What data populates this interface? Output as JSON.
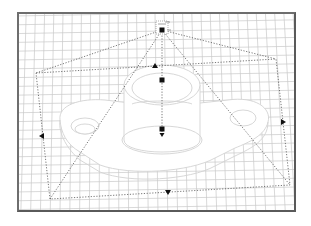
{
  "viewport": {
    "name": "3D perspective viewport",
    "frame_color": "#6e6e6e",
    "grid_color": "#c8c8c8",
    "wire_color": "#d4d4d4",
    "dash_color": "#555555",
    "handle_color": "#111111"
  },
  "light": {
    "type": "spotlight",
    "icon": "spotlight-icon",
    "apex": [
      162,
      30
    ]
  },
  "spot_cone": {
    "base": [
      [
        36,
        73
      ],
      [
        276,
        59
      ],
      [
        290,
        185
      ],
      [
        50,
        199
      ]
    ]
  },
  "handles": [
    {
      "id": "top",
      "x": 155,
      "y": 66,
      "shape": "triangle-up"
    },
    {
      "id": "target-upper",
      "x": 162,
      "y": 80,
      "shape": "square"
    },
    {
      "id": "target-lower",
      "x": 162,
      "y": 129,
      "shape": "square"
    },
    {
      "id": "target-arrow",
      "x": 162,
      "y": 135,
      "shape": "triangle-down"
    },
    {
      "id": "left",
      "x": 42,
      "y": 136,
      "shape": "triangle-left"
    },
    {
      "id": "right",
      "x": 283,
      "y": 122,
      "shape": "triangle-right"
    },
    {
      "id": "bottom",
      "x": 168,
      "y": 192,
      "shape": "triangle-down"
    }
  ],
  "model": {
    "name": "flange part wireframe"
  }
}
